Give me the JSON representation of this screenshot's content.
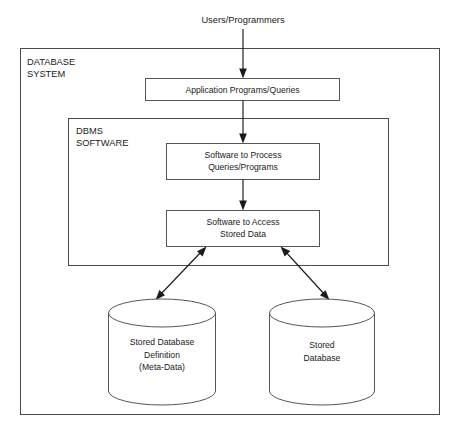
{
  "diagram": {
    "type": "block-diagram",
    "background_color": "#ffffff",
    "line_color": "#555555",
    "arrow_color": "#1a1a1a",
    "text_color": "#1a1a1a",
    "external_actor": {
      "label": "Users/Programmers"
    },
    "regions": [
      {
        "id": "database-system",
        "label_line_1": "DATABASE",
        "label_line_2": "SYSTEM"
      },
      {
        "id": "dbms-software",
        "label_line_1": "DBMS",
        "label_line_2": "SOFTWARE"
      }
    ],
    "process_boxes": [
      {
        "id": "application-programs-queries",
        "line_1": "Application Programs/Queries",
        "line_2": ""
      },
      {
        "id": "software-to-process-queries",
        "line_1": "Software to Process",
        "line_2": "Queries/Programs"
      },
      {
        "id": "software-to-access-stored-data",
        "line_1": "Software to Access",
        "line_2": "Stored Data"
      }
    ],
    "data_stores": [
      {
        "id": "stored-database-definition",
        "line_1": "Stored Database",
        "line_2": "Definition",
        "line_3": "(Meta-Data)"
      },
      {
        "id": "stored-database",
        "line_1": "Stored",
        "line_2": "Database",
        "line_3": ""
      }
    ],
    "connectors": [
      {
        "id": "users-to-application-programs",
        "from": "Users/Programmers",
        "to": "Application Programs/Queries",
        "direction": "one-way"
      },
      {
        "id": "application-programs-to-software-process",
        "from": "Application Programs/Queries",
        "to": "Software to Process Queries/Programs",
        "direction": "one-way"
      },
      {
        "id": "software-process-to-software-access",
        "from": "Software to Process Queries/Programs",
        "to": "Software to Access Stored Data",
        "direction": "one-way"
      },
      {
        "id": "software-access-to-meta-data",
        "from": "Software to Access Stored Data",
        "to": "Stored Database Definition (Meta-Data)",
        "direction": "two-way"
      },
      {
        "id": "software-access-to-stored-database",
        "from": "Software to Access Stored Data",
        "to": "Stored Database",
        "direction": "two-way"
      }
    ]
  }
}
